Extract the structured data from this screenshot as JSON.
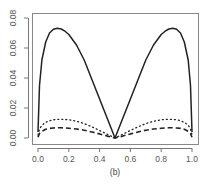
{
  "chart_data": {
    "type": "line",
    "title": "",
    "caption": "(b)",
    "xlabel": "",
    "ylabel": "",
    "xlim": [
      0.0,
      1.0
    ],
    "ylim": [
      0.0,
      0.08
    ],
    "grid": false,
    "legend": null,
    "x_ticks": [
      "0.0",
      "0.2",
      "0.4",
      "0.6",
      "0.8",
      "1.0"
    ],
    "y_ticks": [
      "0.00",
      "0.02",
      "0.04",
      "0.06",
      "0.08"
    ],
    "x": [
      0.0,
      0.01,
      0.025,
      0.05,
      0.075,
      0.1,
      0.125,
      0.15,
      0.175,
      0.2,
      0.25,
      0.3,
      0.35,
      0.4,
      0.45,
      0.5,
      0.55,
      0.6,
      0.65,
      0.7,
      0.75,
      0.8,
      0.825,
      0.85,
      0.875,
      0.9,
      0.925,
      0.95,
      0.975,
      0.99,
      1.0
    ],
    "series": [
      {
        "name": "solid",
        "style": "solid",
        "values": [
          0.004,
          0.035,
          0.052,
          0.064,
          0.07,
          0.0725,
          0.0732,
          0.0727,
          0.0712,
          0.069,
          0.062,
          0.052,
          0.039,
          0.026,
          0.013,
          0.0,
          0.013,
          0.026,
          0.039,
          0.052,
          0.062,
          0.069,
          0.0712,
          0.0727,
          0.0732,
          0.0725,
          0.07,
          0.064,
          0.052,
          0.035,
          0.004
        ]
      },
      {
        "name": "dotted",
        "style": "dotted",
        "values": [
          0.002,
          0.006,
          0.0085,
          0.0105,
          0.0115,
          0.0121,
          0.0124,
          0.0125,
          0.0124,
          0.0121,
          0.0112,
          0.0096,
          0.0075,
          0.005,
          0.0025,
          0.0,
          0.0025,
          0.005,
          0.0075,
          0.0096,
          0.0112,
          0.0121,
          0.0124,
          0.0125,
          0.0124,
          0.0121,
          0.0115,
          0.0105,
          0.0085,
          0.006,
          0.002
        ]
      },
      {
        "name": "dashed",
        "style": "dashed",
        "values": [
          0.0005,
          0.003,
          0.0045,
          0.0058,
          0.0064,
          0.0067,
          0.0068,
          0.0068,
          0.0067,
          0.0065,
          0.006,
          0.0052,
          0.004,
          0.0027,
          0.0013,
          0.0,
          0.0013,
          0.0027,
          0.004,
          0.0052,
          0.006,
          0.0065,
          0.0067,
          0.0068,
          0.0068,
          0.0067,
          0.0064,
          0.0058,
          0.0045,
          0.003,
          0.0005
        ]
      }
    ]
  },
  "layout": {
    "plot_box": {
      "left": 32,
      "top": 13,
      "right": 198,
      "bottom": 144
    },
    "x_pixel": {
      "v0": 38,
      "v1": 192
    },
    "y_pixel": {
      "v0": 138,
      "v008": 18
    },
    "colors": {
      "axis": "#777777",
      "line": "#222222",
      "text": "#555555"
    }
  }
}
